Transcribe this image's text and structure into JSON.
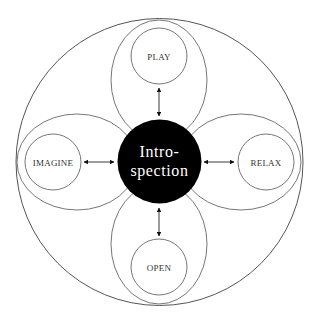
{
  "diagram": {
    "center": {
      "line1": "Intro-",
      "line2": "spection",
      "fill": "#000000",
      "text_color": "#ffffff"
    },
    "nodes": [
      {
        "id": "play",
        "label": "PLAY",
        "position": "top"
      },
      {
        "id": "relax",
        "label": "RELAX",
        "position": "right"
      },
      {
        "id": "open",
        "label": "OPEN",
        "position": "bottom"
      },
      {
        "id": "imagine",
        "label": "IMAGINE",
        "position": "left"
      }
    ],
    "connections": [
      {
        "from": "Introspection",
        "to": "PLAY",
        "type": "bidirectional-arrow"
      },
      {
        "from": "Introspection",
        "to": "RELAX",
        "type": "bidirectional-arrow"
      },
      {
        "from": "Introspection",
        "to": "OPEN",
        "type": "bidirectional-arrow"
      },
      {
        "from": "Introspection",
        "to": "IMAGINE",
        "type": "bidirectional-arrow"
      }
    ],
    "colors": {
      "stroke": "#555555",
      "background": "#ffffff",
      "text": "#333333"
    }
  }
}
